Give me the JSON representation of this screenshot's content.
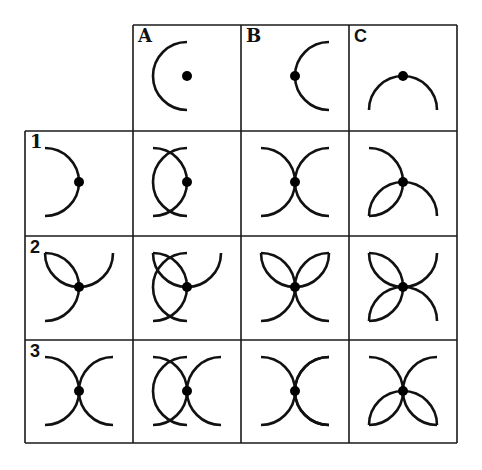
{
  "diagram": {
    "grid": {
      "col_edges": [
        25,
        133,
        241,
        349,
        457
      ],
      "row_edges": [
        25,
        131,
        236,
        340,
        443
      ],
      "line_color": "#1a1a1a",
      "stroke_color": "#111111"
    },
    "columns": [
      {
        "label": "A",
        "label_style": "serif",
        "primitives": [
          "left-centered"
        ]
      },
      {
        "label": "B",
        "label_style": "serif",
        "primitives": [
          "left"
        ]
      },
      {
        "label": "C",
        "label_style": "sans",
        "primitives": [
          "up"
        ]
      }
    ],
    "rows": [
      {
        "label": "1",
        "label_style": "serif",
        "primitives": [
          "right"
        ]
      },
      {
        "label": "2",
        "label_style": "sans",
        "primitives": [
          "right",
          "down"
        ]
      },
      {
        "label": "3",
        "label_style": "sans",
        "primitives": [
          "right",
          "left"
        ]
      }
    ],
    "arc_radius": 34,
    "dot": {
      "x": 54,
      "y": 51,
      "radius": 5
    }
  }
}
